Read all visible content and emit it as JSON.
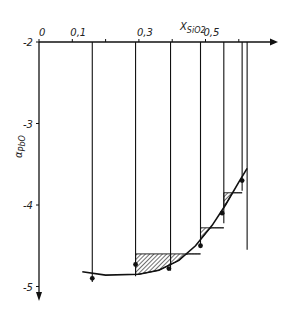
{
  "chart_data": {
    "type": "scatter",
    "title": "",
    "xlabel": "X_SiO2",
    "ylabel": "α_PbO",
    "x_axis_position": "top",
    "x_ticks": [
      0,
      0.1,
      0.3,
      0.5
    ],
    "x_tick_marks": [
      0,
      0.1,
      0.2,
      0.3,
      0.4,
      0.5,
      0.6
    ],
    "y_ticks": [
      -2,
      -3,
      -4,
      -5
    ],
    "xlim": [
      0,
      0.67
    ],
    "ylim": [
      -5,
      -2
    ],
    "vertical_lines_x": [
      0.16,
      0.29,
      0.395,
      0.485,
      0.555,
      0.61,
      0.625
    ],
    "points": [
      {
        "x": 0.16,
        "y": -4.9
      },
      {
        "x": 0.29,
        "y": -4.73
      },
      {
        "x": 0.39,
        "y": -4.78
      },
      {
        "x": 0.485,
        "y": -4.5
      },
      {
        "x": 0.55,
        "y": -4.1
      },
      {
        "x": 0.61,
        "y": -3.7
      }
    ],
    "curve": [
      {
        "x": 0.13,
        "y": -4.82
      },
      {
        "x": 0.2,
        "y": -4.86
      },
      {
        "x": 0.3,
        "y": -4.85
      },
      {
        "x": 0.36,
        "y": -4.8
      },
      {
        "x": 0.42,
        "y": -4.68
      },
      {
        "x": 0.47,
        "y": -4.5
      },
      {
        "x": 0.52,
        "y": -4.25
      },
      {
        "x": 0.56,
        "y": -4.0
      },
      {
        "x": 0.6,
        "y": -3.72
      },
      {
        "x": 0.625,
        "y": -3.55
      }
    ],
    "hatched_steps": [
      {
        "x0": 0.29,
        "x1": 0.395,
        "y_top": -4.6
      },
      {
        "x0": 0.395,
        "x1": 0.485,
        "y_top": -4.6
      },
      {
        "x0": 0.485,
        "x1": 0.555,
        "y_top": -4.28
      },
      {
        "x0": 0.555,
        "x1": 0.61,
        "y_top": -3.85
      }
    ],
    "grid": false,
    "legend": null
  },
  "labels": {
    "x_axis": "X",
    "x_axis_sub": "SiO2",
    "y_axis": "α",
    "y_axis_sub": "PbO"
  }
}
